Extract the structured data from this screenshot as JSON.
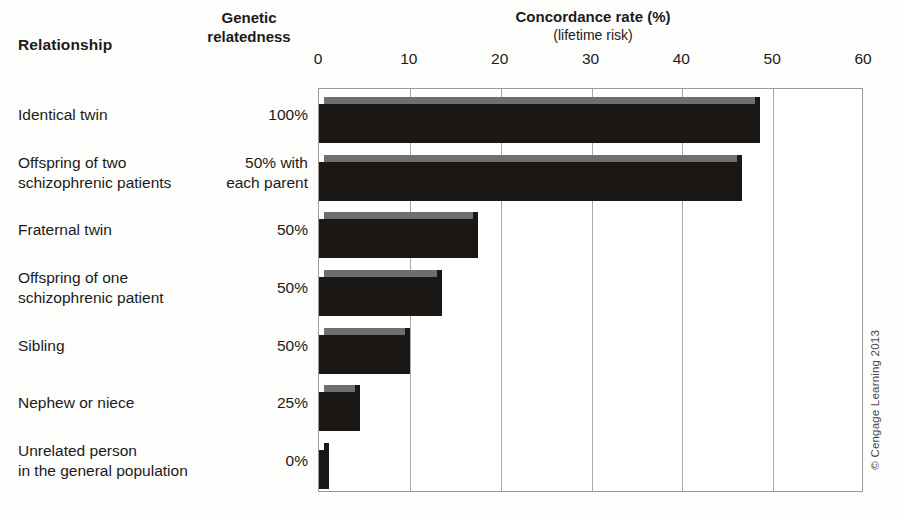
{
  "headers": {
    "relationship": "Relationship",
    "genetic_line1": "Genetic",
    "genetic_line2": "relatedness",
    "concordance": "Concordance rate (%)",
    "lifetime": "(lifetime risk)"
  },
  "credit": "© Cengage Learning 2013",
  "colors": {
    "bar_front": "#1a1714",
    "bar_top": "#6f6f6f",
    "gridline": "#a8a8a8",
    "plot_border": "#9a9a9a",
    "text": "#1b1b1b",
    "background": "#fdfdfc"
  },
  "chart_data": {
    "type": "bar",
    "orientation": "horizontal",
    "title": "Concordance rate (%)",
    "subtitle": "(lifetime risk)",
    "xlabel": "Concordance rate (%) (lifetime risk)",
    "ylabel": "Relationship",
    "xlim": [
      0,
      60
    ],
    "xticks": [
      0,
      10,
      20,
      30,
      40,
      50,
      60
    ],
    "xtick_labels": [
      "0",
      "10",
      "20",
      "30",
      "40",
      "50",
      "60"
    ],
    "grid": true,
    "legend": false,
    "categories": [
      "Identical twin",
      "Offspring of two schizophrenic patients",
      "Fraternal twin",
      "Offspring of one schizophrenic patient",
      "Sibling",
      "Nephew or niece",
      "Unrelated person in the general population"
    ],
    "values": [
      48,
      46,
      17,
      13,
      9.5,
      4,
      0.5
    ],
    "series": [
      {
        "name": "Concordance rate (%)",
        "values": [
          48,
          46,
          17,
          13,
          9.5,
          4,
          0.5
        ]
      }
    ],
    "genetic_relatedness": [
      "100%",
      "50% with each parent",
      "50%",
      "50%",
      "50%",
      "25%",
      "0%"
    ]
  },
  "rows": [
    {
      "label": "Identical twin",
      "label_lines": [
        "Identical twin"
      ],
      "relatedness": "100%",
      "relatedness_lines": [
        "100%"
      ],
      "value": 48
    },
    {
      "label": "Offspring of two schizophrenic patients",
      "label_lines": [
        "Offspring of two",
        "schizophrenic patients"
      ],
      "relatedness": "50% with each parent",
      "relatedness_lines": [
        "50% with",
        "each parent"
      ],
      "value": 46
    },
    {
      "label": "Fraternal twin",
      "label_lines": [
        "Fraternal twin"
      ],
      "relatedness": "50%",
      "relatedness_lines": [
        "50%"
      ],
      "value": 17
    },
    {
      "label": "Offspring of one schizophrenic patient",
      "label_lines": [
        "Offspring of one",
        "schizophrenic patient"
      ],
      "relatedness": "50%",
      "relatedness_lines": [
        "50%"
      ],
      "value": 13
    },
    {
      "label": "Sibling",
      "label_lines": [
        "Sibling"
      ],
      "relatedness": "50%",
      "relatedness_lines": [
        "50%"
      ],
      "value": 9.5
    },
    {
      "label": "Nephew or niece",
      "label_lines": [
        "Nephew or niece"
      ],
      "relatedness": "25%",
      "relatedness_lines": [
        "25%"
      ],
      "value": 4
    },
    {
      "label": "Unrelated person in the general population",
      "label_lines": [
        "Unrelated person",
        "in the general population"
      ],
      "relatedness": "0%",
      "relatedness_lines": [
        "0%"
      ],
      "value": 0.5
    }
  ]
}
